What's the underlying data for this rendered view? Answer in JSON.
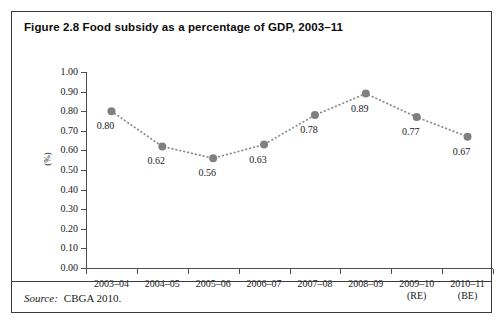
{
  "figure": {
    "title": "Figure 2.8 Food subsidy as a percentage of GDP, 2003–11",
    "source_label": "Source:",
    "source_text": "CBGA 2010."
  },
  "chart_data": {
    "type": "line",
    "title": "Figure 2.8 Food subsidy as a percentage of GDP, 2003–11",
    "xlabel": "",
    "ylabel": "(%)",
    "categories": [
      "2003–04",
      "2004–05",
      "2005–06",
      "2006–07",
      "2007–08",
      "2008–09",
      "2009–10",
      "2010–11"
    ],
    "category_notes": [
      "",
      "",
      "",
      "",
      "",
      "",
      "(RE)",
      "(BE)"
    ],
    "values": [
      0.8,
      0.62,
      0.56,
      0.63,
      0.78,
      0.89,
      0.77,
      0.67
    ],
    "data_labels": [
      "0.80",
      "0.62",
      "0.56",
      "0.63",
      "0.78",
      "0.89",
      "0.77",
      "0.67"
    ],
    "ylim": [
      0.0,
      1.0
    ],
    "ytick_values": [
      1.0,
      0.9,
      0.8,
      0.7,
      0.6,
      0.5,
      0.4,
      0.3,
      0.2,
      0.1,
      0.0
    ],
    "ytick_labels": [
      "1.00",
      "0.90",
      "0.80",
      "0.70",
      "0.60",
      "0.50",
      "0.40",
      "0.30",
      "0.20",
      "0.10",
      "0.00"
    ],
    "grid": false,
    "legend": "none",
    "line_style": "dotted",
    "marker": "circle",
    "marker_color": "#808080",
    "line_color": "#8c8c8c"
  }
}
